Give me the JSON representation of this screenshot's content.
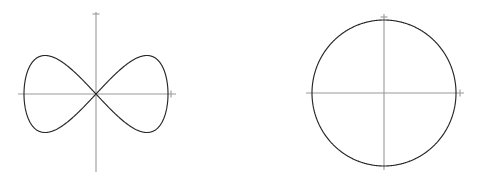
{
  "figure": {
    "background_color": "#ffffff",
    "axis_color": "#9a9a9a",
    "curve_color": "#262626",
    "width": 478,
    "height": 178
  },
  "chart_data": [
    {
      "type": "line",
      "name": "lissajous-figure-eight",
      "title": "",
      "xlabel": "",
      "ylabel": "",
      "grid": false,
      "legend": null,
      "axes": {
        "origin_px": [
          96,
          94
        ],
        "x_axis_px": [
          18,
          176
        ],
        "y_axis_px": [
          12,
          172
        ],
        "x_tick_px": 171,
        "y_tick_px": 14
      },
      "parametric": {
        "x_expr": "a*sin(t)",
        "y_expr": "b*sin(2t)",
        "a": 72,
        "b": 77,
        "t_range": [
          0,
          6.283185307179586
        ],
        "rotation_deg": 0
      },
      "x": [
        0.0,
        0.2,
        0.4,
        0.6,
        0.8,
        1.0,
        1.2,
        1.4,
        1.5708,
        1.8,
        2.0,
        2.2,
        2.4,
        2.6,
        2.8,
        3.0,
        3.1416,
        3.4,
        3.6,
        3.8,
        4.0,
        4.2,
        4.4,
        4.6,
        4.7124,
        5.0,
        5.2,
        5.4,
        5.6,
        5.8,
        6.0,
        6.2832
      ],
      "values": [
        0,
        0.389,
        0.717,
        0.932,
        0.999,
        0.909,
        0.675,
        0.335,
        0.0,
        -0.443,
        -0.757,
        -0.951,
        -0.996,
        -0.884,
        -0.631,
        -0.279,
        0.0,
        0.492,
        0.795,
        0.969,
        0.989,
        0.855,
        0.585,
        0.222,
        0.0,
        0.544,
        0.83,
        0.983,
        0.976,
        0.823,
        0.537,
        0.0
      ],
      "ylim": [
        -77,
        77
      ],
      "xlim": [
        -72,
        72
      ],
      "description": "Figure-eight / bowtie curve crossing itself at the origin; two lobes, one above and one below the x-axis"
    },
    {
      "type": "line",
      "name": "circle",
      "title": "",
      "xlabel": "",
      "ylabel": "",
      "grid": false,
      "legend": null,
      "axes": {
        "origin_px": [
          384,
          93
        ],
        "x_axis_px": [
          306,
          464
        ],
        "y_axis_px": [
          14,
          170
        ],
        "x_tick_px": 460,
        "y_tick_px": 17
      },
      "parametric": {
        "x_expr": "r*cos(t)",
        "y_expr": "r*sin(t)",
        "r": 72,
        "t_range": [
          0,
          6.283185307179586
        ],
        "rotation_deg": 0
      },
      "x": [
        0.0,
        0.524,
        1.047,
        1.5708,
        2.094,
        2.618,
        3.1416,
        3.665,
        4.189,
        4.712,
        5.236,
        5.76,
        6.2832
      ],
      "values": [
        1.0,
        0.866,
        0.5,
        0.0,
        -0.5,
        -0.866,
        -1.0,
        -0.866,
        -0.5,
        0.0,
        0.5,
        0.866,
        1.0
      ],
      "ylim": [
        -73,
        73
      ],
      "xlim": [
        -72,
        72
      ],
      "description": "Closed circular curve centered on the origin of the coordinate axes"
    }
  ]
}
